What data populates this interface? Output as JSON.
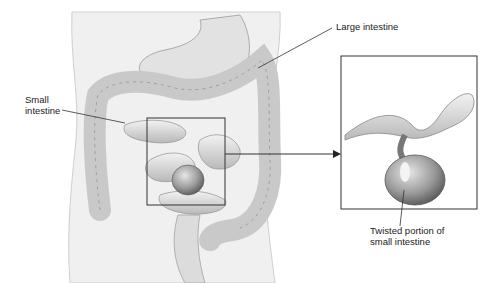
{
  "diagram": {
    "labels": {
      "small_intestine": "Small\nintestine",
      "large_intestine": "Large intestine",
      "twisted_portion": "Twisted portion of\nsmall intestine"
    },
    "callouts": [
      {
        "label": "Small intestine",
        "points_to": "small intestine loop, upper left of highlighted box"
      },
      {
        "label": "Large intestine",
        "points_to": "transverse/descending colon on right"
      },
      {
        "label": "Twisted portion of small intestine",
        "points_to": "twisted loop inside inset"
      }
    ],
    "highlight_box": "Region of the small intestine, enlarged in the inset",
    "inset": "Enlarged view of the twisted portion",
    "colors": {
      "line": "#333333",
      "tissue": "#d9d9d9",
      "tissue_dark": "#8a8a8a",
      "body": "#efefef"
    }
  }
}
